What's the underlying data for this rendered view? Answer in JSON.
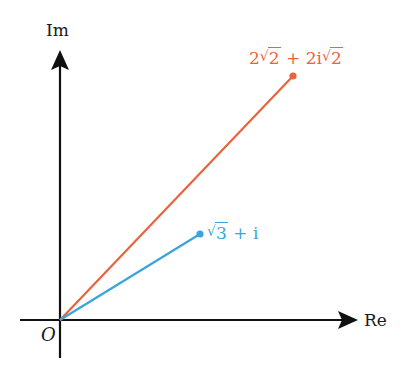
{
  "diagram": {
    "axes": {
      "x_label": "Re",
      "y_label": "Im",
      "origin_label": "O",
      "color": "#111111"
    },
    "vectors": [
      {
        "name": "orange-vector",
        "label_parts": {
          "a": "2",
          "a_rad": "2",
          "op": "+",
          "b": "2i",
          "b_rad": "2"
        },
        "label_text": "2√2 + 2i√2",
        "color": "#e8643c",
        "tip": {
          "x": 293,
          "y": 76
        }
      },
      {
        "name": "blue-vector",
        "label_parts": {
          "rad": "3",
          "op": "+",
          "b": "i"
        },
        "label_text": "√3 + i",
        "color": "#3aa4dc",
        "tip": {
          "x": 200,
          "y": 234
        }
      }
    ],
    "origin": {
      "x": 60,
      "y": 320
    }
  }
}
